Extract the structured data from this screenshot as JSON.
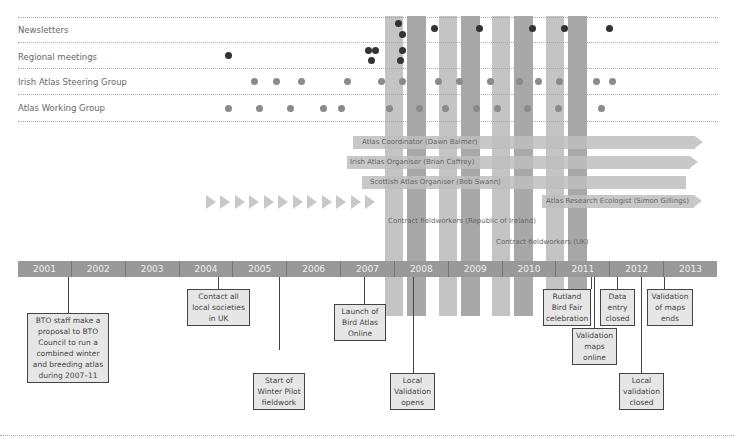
{
  "header_partial_text": "",
  "rows": [
    {
      "label": "Newsletters"
    },
    {
      "label": "Regional meetings"
    },
    {
      "label": "Irish Atlas Steering Group"
    },
    {
      "label": "Atlas Working Group"
    }
  ],
  "roles": [
    {
      "label": "Atlas Coordinator (Dawn Balmer)"
    },
    {
      "label": "Irish Atlas Organiser (Brian Caffrey)"
    },
    {
      "label": "Scottish Atlas Organiser (Bob Swann)"
    },
    {
      "label": "Atlas Research Ecologist (Simon Gillings)"
    },
    {
      "label": "Contract fieldworkers (Republic of Ireland)"
    },
    {
      "label": "Contract fieldworkers (UK)"
    }
  ],
  "years": [
    "2001",
    "2002",
    "2003",
    "2004",
    "2005",
    "2006",
    "2007",
    "2008",
    "2009",
    "2010",
    "2011",
    "2012",
    "2013"
  ],
  "events": [
    {
      "text": "BTO staff make a proposal to BTO Council to run a combined winter and breeding atlas during 2007–11"
    },
    {
      "text": "Contact all local societies in UK"
    },
    {
      "text": "Start of Winter Pilot fieldwork"
    },
    {
      "text": "Launch of Bird Atlas Online"
    },
    {
      "text": "Local Validation opens"
    },
    {
      "text": "Rutland Bird Fair celebration"
    },
    {
      "text": "Validation maps online"
    },
    {
      "text": "Data entry closed"
    },
    {
      "text": "Local validation closed"
    },
    {
      "text": "Validation of maps ends"
    }
  ],
  "colors": {
    "band_light": "#c4c4c4",
    "band_dark": "#a8a8a8",
    "dot_dark": "#333333",
    "dot_grey": "#8a8a8a",
    "year_bar": "#999999"
  }
}
